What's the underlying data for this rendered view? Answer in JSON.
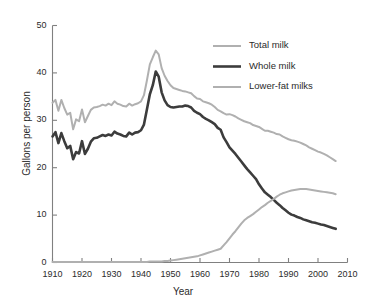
{
  "chart_data": {
    "type": "line",
    "title": "",
    "xlabel": "Year",
    "ylabel": "Gallons per person",
    "xlim": [
      1910,
      2010
    ],
    "ylim": [
      0,
      50
    ],
    "xticks": [
      1910,
      1920,
      1930,
      1940,
      1950,
      1960,
      1970,
      1980,
      1990,
      2000,
      2010
    ],
    "yticks": [
      0,
      10,
      20,
      30,
      40,
      50
    ],
    "grid": false,
    "legend_position": "top-right",
    "colors": {
      "total_milk": "#b0b0b0",
      "whole_milk": "#3c3c3c",
      "lower_fat_milks": "#b0b0b0",
      "axis": "#808080",
      "text": "#2b2b2b"
    },
    "x": [
      1910,
      1911,
      1912,
      1913,
      1914,
      1915,
      1916,
      1917,
      1918,
      1919,
      1920,
      1921,
      1922,
      1923,
      1924,
      1925,
      1926,
      1927,
      1928,
      1929,
      1930,
      1931,
      1932,
      1933,
      1934,
      1935,
      1936,
      1937,
      1938,
      1939,
      1940,
      1941,
      1942,
      1943,
      1944,
      1945,
      1946,
      1947,
      1948,
      1949,
      1950,
      1951,
      1952,
      1953,
      1954,
      1955,
      1956,
      1957,
      1958,
      1959,
      1960,
      1961,
      1962,
      1963,
      1964,
      1965,
      1966,
      1967,
      1968,
      1969,
      1970,
      1971,
      1972,
      1973,
      1974,
      1975,
      1976,
      1977,
      1978,
      1979,
      1980,
      1981,
      1982,
      1983,
      1984,
      1985,
      1986,
      1987,
      1988,
      1989,
      1990,
      1991,
      1992,
      1993,
      1994,
      1995,
      1996,
      1997,
      1998,
      1999,
      2000,
      2001,
      2002,
      2003,
      2004,
      2005,
      2006
    ],
    "series": [
      {
        "name": "Total milk",
        "color": "#b0b0b0",
        "width": 2.0,
        "values": [
          33.7,
          34.3,
          32.0,
          34.3,
          32.6,
          31.2,
          31.6,
          28.1,
          30.2,
          29.8,
          32.3,
          29.6,
          30.9,
          32.2,
          32.7,
          32.8,
          33.0,
          33.3,
          33.1,
          33.5,
          33.2,
          34.0,
          33.5,
          33.3,
          33.0,
          32.9,
          33.5,
          33.1,
          33.4,
          33.6,
          34.0,
          35.3,
          38.4,
          41.8,
          43.3,
          44.7,
          43.9,
          41.0,
          39.4,
          38.3,
          37.4,
          36.8,
          36.6,
          36.4,
          36.2,
          36.1,
          35.9,
          35.7,
          35.1,
          34.6,
          34.5,
          34.0,
          33.8,
          33.6,
          33.3,
          32.8,
          32.2,
          31.9,
          31.5,
          31.2,
          31.3,
          31.1,
          30.8,
          30.4,
          30.1,
          29.8,
          29.6,
          29.4,
          29.0,
          28.8,
          28.6,
          28.2,
          27.8,
          27.8,
          27.6,
          27.4,
          27.1,
          27.0,
          26.6,
          26.3,
          26.0,
          25.8,
          25.7,
          25.5,
          25.3,
          25.0,
          24.7,
          24.3,
          24.0,
          23.7,
          23.4,
          23.2,
          22.9,
          22.6,
          22.2,
          21.8,
          21.4
        ]
      },
      {
        "name": "Whole milk",
        "color": "#3c3c3c",
        "width": 2.6,
        "values": [
          26.6,
          27.5,
          25.2,
          27.3,
          25.6,
          24.1,
          24.6,
          21.8,
          23.3,
          23.0,
          25.6,
          22.9,
          24.0,
          25.5,
          26.2,
          26.3,
          26.6,
          26.9,
          26.7,
          27.0,
          26.8,
          27.6,
          27.2,
          27.0,
          26.7,
          26.6,
          27.4,
          27.0,
          27.4,
          27.5,
          27.9,
          29.1,
          32.3,
          35.5,
          37.4,
          40.3,
          39.2,
          35.9,
          34.2,
          33.2,
          32.8,
          32.7,
          32.8,
          32.9,
          32.9,
          33.1,
          33.0,
          32.7,
          32.0,
          31.6,
          31.3,
          30.7,
          30.3,
          30.0,
          29.6,
          29.2,
          28.4,
          28.0,
          26.4,
          25.4,
          24.3,
          23.6,
          22.9,
          22.1,
          21.3,
          20.5,
          19.7,
          19.0,
          18.3,
          17.6,
          16.5,
          15.6,
          14.8,
          14.3,
          13.8,
          13.2,
          12.6,
          12.1,
          11.5,
          11.0,
          10.5,
          10.1,
          9.9,
          9.6,
          9.4,
          9.1,
          8.9,
          8.7,
          8.5,
          8.4,
          8.2,
          8.0,
          7.9,
          7.7,
          7.5,
          7.3,
          7.1
        ]
      },
      {
        "name": "Lower-fat milks",
        "color": "#b0b0b0",
        "width": 2.0,
        "values": [
          0.1,
          0.1,
          0.1,
          0.1,
          0.1,
          0.1,
          0.1,
          0.1,
          0.1,
          0.1,
          0.1,
          0.1,
          0.1,
          0.1,
          0.1,
          0.1,
          0.1,
          0.1,
          0.1,
          0.1,
          0.1,
          0.1,
          0.1,
          0.1,
          0.1,
          0.1,
          0.1,
          0.1,
          0.1,
          0.1,
          0.1,
          0.1,
          0.1,
          0.2,
          0.2,
          0.2,
          0.2,
          0.2,
          0.3,
          0.3,
          0.4,
          0.5,
          0.6,
          0.7,
          0.8,
          0.9,
          1.0,
          1.1,
          1.2,
          1.3,
          1.5,
          1.7,
          1.9,
          2.1,
          2.3,
          2.5,
          2.7,
          2.9,
          3.6,
          4.3,
          5.1,
          5.9,
          6.6,
          7.4,
          8.2,
          8.9,
          9.4,
          9.8,
          10.2,
          10.7,
          11.2,
          11.7,
          12.1,
          12.6,
          13.0,
          13.4,
          13.9,
          14.3,
          14.6,
          14.8,
          15.0,
          15.2,
          15.3,
          15.4,
          15.5,
          15.5,
          15.5,
          15.4,
          15.3,
          15.2,
          15.1,
          15.0,
          14.9,
          14.8,
          14.7,
          14.6,
          14.4
        ]
      }
    ]
  },
  "axes": {
    "ylabel": "Gallons per person",
    "xlabel": "Year",
    "ytick_labels": [
      "0",
      "10",
      "20",
      "30",
      "40",
      "50"
    ],
    "xtick_labels": [
      "1910",
      "1920",
      "1930",
      "1940",
      "1950",
      "1960",
      "1970",
      "1980",
      "1990",
      "2000",
      "2010"
    ]
  },
  "legend": {
    "items": [
      {
        "label": "Total milk"
      },
      {
        "label": "Whole milk"
      },
      {
        "label": "Lower-fat milks"
      }
    ]
  }
}
